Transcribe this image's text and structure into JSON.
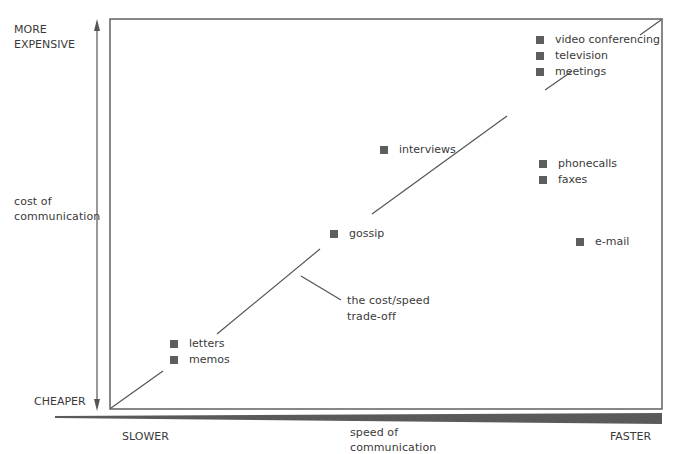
{
  "diagram": {
    "y_axis": {
      "top_label_line1": "MORE",
      "top_label_line2": "EXPENSIVE",
      "middle_label_line1": "cost of",
      "middle_label_line2": "communication",
      "bottom_label": "CHEAPER"
    },
    "x_axis": {
      "left_label": "SLOWER",
      "middle_label_line1": "speed of",
      "middle_label_line2": "communication",
      "right_label": "FASTER"
    },
    "tradeoff_annotation": {
      "line1": "the cost/speed",
      "line2": "trade-off"
    },
    "items": [
      {
        "label": "video conferencing",
        "speed": "fast",
        "cost": "expensive"
      },
      {
        "label": "television",
        "speed": "fast",
        "cost": "expensive"
      },
      {
        "label": "meetings",
        "speed": "fast",
        "cost": "expensive"
      },
      {
        "label": "interviews",
        "speed": "medium",
        "cost": "medium-high"
      },
      {
        "label": "phonecalls",
        "speed": "fast",
        "cost": "medium-high"
      },
      {
        "label": "faxes",
        "speed": "fast",
        "cost": "medium-high"
      },
      {
        "label": "gossip",
        "speed": "medium",
        "cost": "medium"
      },
      {
        "label": "e-mail",
        "speed": "fast",
        "cost": "medium"
      },
      {
        "label": "letters",
        "speed": "slow",
        "cost": "cheap"
      },
      {
        "label": "memos",
        "speed": "slow",
        "cost": "cheap"
      }
    ],
    "colors": {
      "lines": "#555555",
      "marker": "#5e5e5e",
      "text": "#3a3a3a"
    }
  }
}
